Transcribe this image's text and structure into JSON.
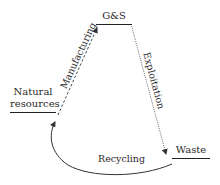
{
  "diagram": {
    "type": "cycle",
    "nodes": {
      "goods_services": {
        "label": "G&S"
      },
      "natural_resources": {
        "line1": "Natural",
        "line2": "resources"
      },
      "waste": {
        "label": "Waste"
      }
    },
    "edges": {
      "manufacturing": {
        "label": "Manufacturing",
        "from": "Natural resources",
        "to": "G&S",
        "style": "dashed"
      },
      "exploitation": {
        "label": "Exploitation",
        "from": "G&S",
        "to": "Waste",
        "style": "dotted"
      },
      "recycling": {
        "label": "Recycling",
        "from": "Waste",
        "to": "Natural resources",
        "style": "solid-curve"
      }
    },
    "colors": {
      "line": "#333333",
      "text": "#2a2a2a",
      "background": "#ffffff"
    }
  }
}
